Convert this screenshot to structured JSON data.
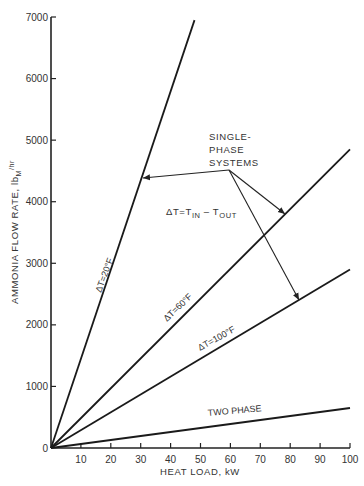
{
  "chart_data": {
    "type": "line",
    "title": "",
    "xlabel": "HEAT LOAD, kW",
    "ylabel": "AMMONIA FLOW RATE, lbM/hr",
    "ylabel_parts": {
      "main": "AMMONIA FLOW RATE, lb",
      "sub": "M",
      "tail": "/hr"
    },
    "xlim": [
      0,
      100
    ],
    "ylim": [
      0,
      7000
    ],
    "xticks": [
      10,
      20,
      30,
      40,
      50,
      60,
      70,
      80,
      90,
      100
    ],
    "xtick_labels": [
      "10",
      "20",
      "30",
      "40",
      "50",
      "60",
      "70",
      "80",
      "90",
      "100"
    ],
    "yticks": [
      0,
      1000,
      2000,
      3000,
      4000,
      5000,
      6000,
      7000
    ],
    "ytick_labels": [
      "0",
      "1000",
      "2000",
      "3000",
      "4000",
      "5000",
      "6000",
      "7000"
    ],
    "grid": false,
    "legend": null,
    "series": [
      {
        "name": "ΔT=20°F",
        "label": "ΔT=20°F",
        "x": [
          0,
          48
        ],
        "y": [
          0,
          6950
        ]
      },
      {
        "name": "ΔT=60°F",
        "label": "ΔT=60°F",
        "x": [
          0,
          100
        ],
        "y": [
          0,
          4850
        ]
      },
      {
        "name": "ΔT=100°F",
        "label": "ΔT=100°F",
        "x": [
          0,
          100
        ],
        "y": [
          0,
          2900
        ]
      },
      {
        "name": "TWO PHASE",
        "label": "TWO PHASE",
        "x": [
          0,
          100
        ],
        "y": [
          0,
          650
        ]
      }
    ],
    "annotations": [
      {
        "text": [
          "SINGLE-",
          "PHASE",
          "SYSTEMS"
        ],
        "anchor": [
          59,
          4550
        ],
        "arrows_to": [
          "ΔT=20°F",
          "ΔT=60°F",
          "ΔT=100°F"
        ]
      },
      {
        "text_parts": {
          "a": "ΔT=T",
          "a_sub": "IN",
          "b": " – T",
          "b_sub": "OUT"
        }
      }
    ]
  }
}
